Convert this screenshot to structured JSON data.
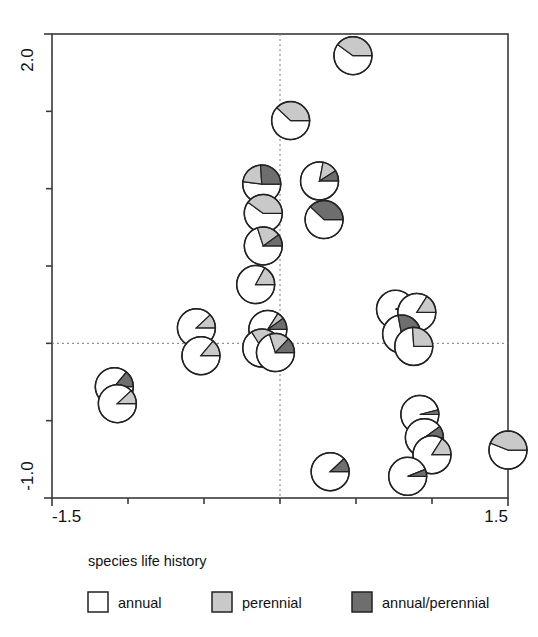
{
  "chart_data": {
    "type": "scatter",
    "marker": "pie",
    "title": "",
    "xlabel": "",
    "ylabel": "",
    "xlim": [
      -1.5,
      1.5
    ],
    "ylim": [
      -1.0,
      2.0
    ],
    "x_ticks": [
      -1.5,
      -1.0,
      -0.5,
      0.0,
      0.5,
      1.0,
      1.5
    ],
    "y_ticks": [
      -1.0,
      -0.5,
      0.0,
      0.5,
      1.0,
      1.5,
      2.0
    ],
    "x_tick_labels_shown": [
      "-1.5",
      "1.5"
    ],
    "y_tick_labels_shown": [
      "-1.0",
      "2.0"
    ],
    "grid": false,
    "reference_lines": {
      "x": 0.0,
      "y": 0.0,
      "style": "dotted"
    },
    "legend_position": "below-axes",
    "categories": [
      "annual",
      "perennial",
      "annual/perennial"
    ],
    "category_colors": [
      "#ffffff",
      "#c9c9c9",
      "#6e6e6e"
    ],
    "points": [
      {
        "x": 0.48,
        "y": 1.86,
        "fractions": [
          0.6,
          0.4,
          0.0
        ]
      },
      {
        "x": 0.07,
        "y": 1.44,
        "fractions": [
          0.62,
          0.38,
          0.0
        ]
      },
      {
        "x": -0.12,
        "y": 1.03,
        "fractions": [
          0.52,
          0.22,
          0.26
        ]
      },
      {
        "x": -0.11,
        "y": 0.84,
        "fractions": [
          0.6,
          0.4,
          0.0
        ]
      },
      {
        "x": -0.11,
        "y": 0.63,
        "fractions": [
          0.7,
          0.2,
          0.1
        ]
      },
      {
        "x": 0.26,
        "y": 1.05,
        "fractions": [
          0.78,
          0.13,
          0.09
        ]
      },
      {
        "x": 0.29,
        "y": 0.8,
        "fractions": [
          0.62,
          0.0,
          0.38
        ]
      },
      {
        "x": -0.16,
        "y": 0.38,
        "fractions": [
          0.83,
          0.17,
          0.0
        ]
      },
      {
        "x": -0.55,
        "y": 0.1,
        "fractions": [
          0.88,
          0.12,
          0.0
        ]
      },
      {
        "x": -0.08,
        "y": 0.09,
        "fractions": [
          0.84,
          0.06,
          0.1
        ]
      },
      {
        "x": -0.12,
        "y": -0.03,
        "fractions": [
          0.66,
          0.34,
          0.0
        ]
      },
      {
        "x": -0.03,
        "y": -0.06,
        "fractions": [
          0.7,
          0.17,
          0.13
        ]
      },
      {
        "x": -0.52,
        "y": -0.08,
        "fractions": [
          0.86,
          0.14,
          0.0
        ]
      },
      {
        "x": -1.09,
        "y": -0.28,
        "fractions": [
          0.86,
          0.0,
          0.14
        ]
      },
      {
        "x": -1.07,
        "y": -0.39,
        "fractions": [
          0.88,
          0.12,
          0.0
        ]
      },
      {
        "x": 0.76,
        "y": 0.22,
        "fractions": [
          0.94,
          0.0,
          0.06
        ]
      },
      {
        "x": 0.9,
        "y": 0.2,
        "fractions": [
          0.84,
          0.16,
          0.0
        ]
      },
      {
        "x": 0.8,
        "y": 0.06,
        "fractions": [
          0.72,
          0.0,
          0.28
        ]
      },
      {
        "x": 0.88,
        "y": -0.02,
        "fractions": [
          0.74,
          0.26,
          0.0
        ]
      },
      {
        "x": 0.92,
        "y": -0.46,
        "fractions": [
          0.96,
          0.0,
          0.04
        ]
      },
      {
        "x": 0.95,
        "y": -0.61,
        "fractions": [
          0.9,
          0.0,
          0.1
        ]
      },
      {
        "x": 1.0,
        "y": -0.72,
        "fractions": [
          0.84,
          0.16,
          0.0
        ]
      },
      {
        "x": 0.33,
        "y": -0.83,
        "fractions": [
          0.88,
          0.0,
          0.12
        ]
      },
      {
        "x": 0.84,
        "y": -0.86,
        "fractions": [
          0.94,
          0.0,
          0.06
        ]
      },
      {
        "x": 1.5,
        "y": -0.69,
        "fractions": [
          0.56,
          0.44,
          0.0
        ]
      }
    ]
  },
  "axes": {
    "y_top_label": "2.0",
    "y_bottom_label": "-1.0",
    "x_left_label": "-1.5",
    "x_right_label": "1.5"
  },
  "legend": {
    "title": "species life history",
    "items": [
      {
        "label": "annual",
        "color": "#ffffff"
      },
      {
        "label": "perennial",
        "color": "#c9c9c9"
      },
      {
        "label": "annual/perennial",
        "color": "#6e6e6e"
      }
    ]
  }
}
